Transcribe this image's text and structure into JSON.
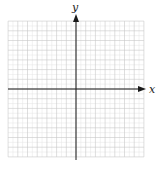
{
  "chart_data": {
    "type": "scatter",
    "title": "",
    "xlabel": "x",
    "ylabel": "y",
    "xlim": [
      -7,
      7
    ],
    "ylim": [
      -7,
      7
    ],
    "grid": true,
    "minor_grid": true,
    "series": [],
    "legend": null
  },
  "graph": {
    "x_axis_label": "x",
    "y_axis_label": "y",
    "colors": {
      "axis": "#1a1a1a",
      "major_grid": "#c8c8c8",
      "minor_grid": "#e4e4e4",
      "background": "#ffffff"
    }
  }
}
